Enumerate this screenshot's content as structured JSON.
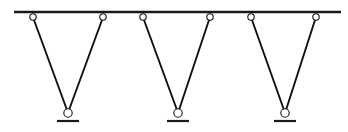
{
  "diagram": {
    "canvas": {
      "width": 348,
      "height": 132,
      "background": "#ffffff"
    },
    "colors": {
      "rail": "#1a1a1a",
      "cable": "#111111",
      "node_stroke": "#111111",
      "node_fill": "#ffffff",
      "base": "#1a1a1a"
    },
    "strokes": {
      "rail_width": 2.6,
      "cable_width": 1.9,
      "node_radius": 3.2,
      "node_stroke_width": 1.1,
      "base_width": 2.2,
      "base_half_length": 11
    },
    "rail": {
      "label": "top-rail",
      "x1": 14,
      "x2": 341,
      "y": 12
    },
    "top_nodes": [
      {
        "label": "top-node-1",
        "cx": 33,
        "cy": 17
      },
      {
        "label": "top-node-2",
        "cx": 103,
        "cy": 17
      },
      {
        "label": "top-node-3",
        "cx": 143,
        "cy": 17
      },
      {
        "label": "top-node-4",
        "cx": 210,
        "cy": 17
      },
      {
        "label": "top-node-5",
        "cx": 251,
        "cy": 17
      },
      {
        "label": "top-node-6",
        "cx": 316,
        "cy": 17
      }
    ],
    "bottom_nodes": [
      {
        "label": "bottom-node-1",
        "cx": 68,
        "cy": 113
      },
      {
        "label": "bottom-node-2",
        "cx": 178,
        "cy": 113
      },
      {
        "label": "bottom-node-3",
        "cx": 285,
        "cy": 113
      }
    ],
    "base_supports": [
      {
        "label": "base-support-1",
        "cx": 68,
        "y": 121
      },
      {
        "label": "base-support-2",
        "cx": 178,
        "y": 121
      },
      {
        "label": "base-support-3",
        "cx": 285,
        "y": 121
      }
    ],
    "cables": [
      {
        "label": "cable-1-left",
        "x1": 34,
        "y1": 20,
        "x2": 67,
        "y2": 110
      },
      {
        "label": "cable-1-right",
        "x1": 102,
        "y1": 20,
        "x2": 69,
        "y2": 110
      },
      {
        "label": "cable-2-left",
        "x1": 144,
        "y1": 20,
        "x2": 177,
        "y2": 110
      },
      {
        "label": "cable-2-right",
        "x1": 209,
        "y1": 20,
        "x2": 179,
        "y2": 110
      },
      {
        "label": "cable-3-left",
        "x1": 252,
        "y1": 20,
        "x2": 284,
        "y2": 110
      },
      {
        "label": "cable-3-right",
        "x1": 315,
        "y1": 20,
        "x2": 286,
        "y2": 110
      }
    ]
  }
}
